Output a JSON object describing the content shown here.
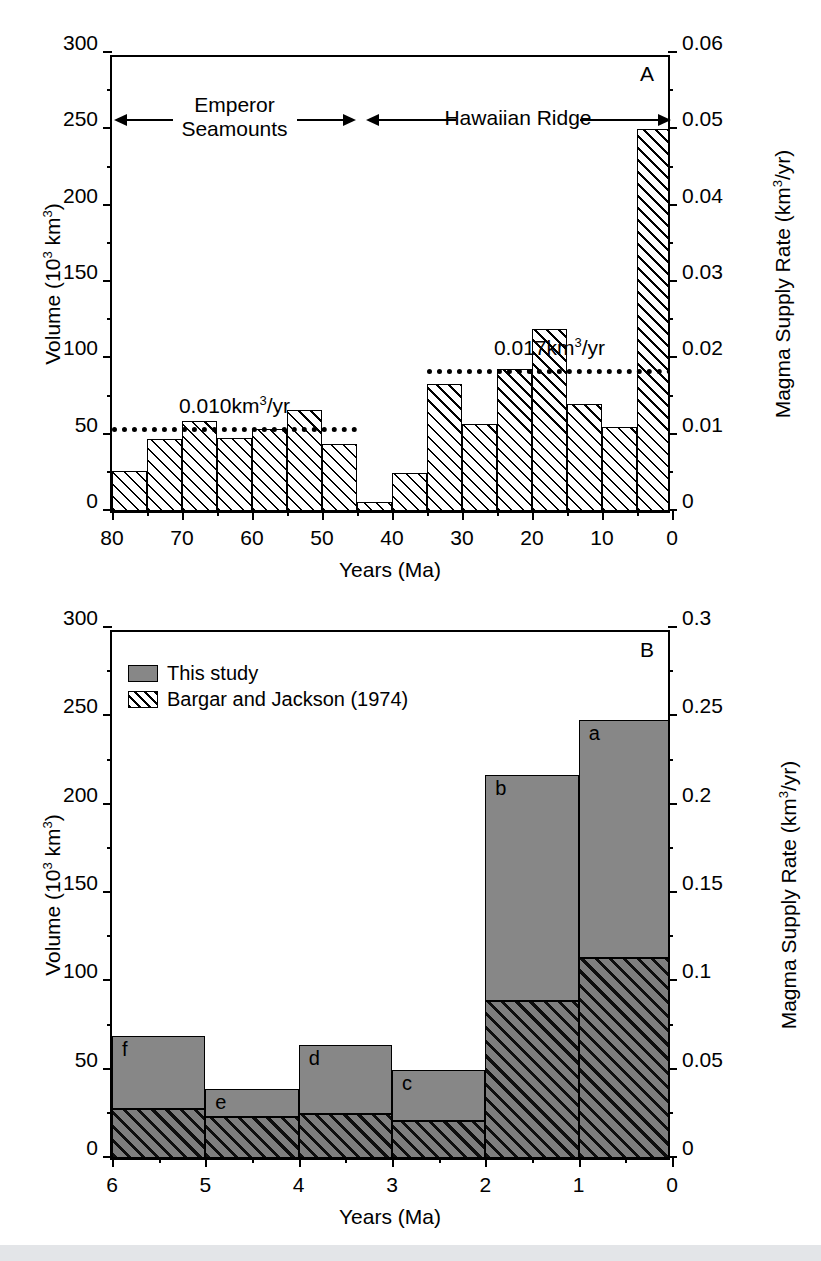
{
  "figure": {
    "panel_a_letter": "A",
    "panel_b_letter": "B"
  },
  "chart_data": [
    {
      "id": "panel-a",
      "type": "bar",
      "title": "",
      "panel_label": "A",
      "xlabel": "Years (Ma)",
      "ylabel": "Volume (10³ km³)",
      "y2label": "Magma Supply Rate (km³/yr)",
      "xlim": [
        80,
        0
      ],
      "ylim": [
        0,
        300
      ],
      "y2lim": [
        0,
        0.06
      ],
      "x_reversed": true,
      "grid": false,
      "legend": "none",
      "xticks": [
        80,
        75,
        70,
        65,
        60,
        55,
        50,
        45,
        40,
        35,
        30,
        25,
        20,
        15,
        10,
        5,
        0
      ],
      "xticklabels": [
        "80",
        "",
        "70",
        "",
        "60",
        "",
        "50",
        "",
        "40",
        "",
        "30",
        "",
        "20",
        "",
        "10",
        "",
        "0"
      ],
      "yticks": [
        0,
        50,
        100,
        150,
        200,
        250,
        300
      ],
      "yticklabels": [
        "0",
        "50",
        "100",
        "150",
        "200",
        "250",
        "300"
      ],
      "y2ticks": [
        0,
        0.01,
        0.02,
        0.03,
        0.04,
        0.05,
        0.06
      ],
      "y2ticklabels": [
        "0",
        "0.01",
        "0.02",
        "0.03",
        "0.04",
        "0.05",
        "0.06"
      ],
      "bin_width_ma": 5,
      "bins": [
        {
          "from": 80,
          "to": 75,
          "value": 26
        },
        {
          "from": 75,
          "to": 70,
          "value": 47
        },
        {
          "from": 70,
          "to": 65,
          "value": 59
        },
        {
          "from": 65,
          "to": 60,
          "value": 48
        },
        {
          "from": 60,
          "to": 55,
          "value": 54
        },
        {
          "from": 55,
          "to": 50,
          "value": 66
        },
        {
          "from": 50,
          "to": 45,
          "value": 44
        },
        {
          "from": 45,
          "to": 40,
          "value": 6
        },
        {
          "from": 40,
          "to": 35,
          "value": 25
        },
        {
          "from": 35,
          "to": 30,
          "value": 83
        },
        {
          "from": 30,
          "to": 25,
          "value": 57
        },
        {
          "from": 25,
          "to": 20,
          "value": 93
        },
        {
          "from": 20,
          "to": 15,
          "value": 119
        },
        {
          "from": 15,
          "to": 10,
          "value": 70
        },
        {
          "from": 10,
          "to": 5,
          "value": 55
        },
        {
          "from": 5,
          "to": 0,
          "value": 250
        }
      ],
      "reference_lines": [
        {
          "label": "0.010km³/yr",
          "value_rate": 0.01,
          "value_volume": 52,
          "from": 80,
          "to": 45
        },
        {
          "label": "0.017km³/yr",
          "value_rate": 0.017,
          "value_volume": 90,
          "from": 35,
          "to": 0
        }
      ],
      "range_annotations": [
        {
          "label_line1": "Emperor",
          "label_line2": "Seamounts",
          "from": 80,
          "to": 45
        },
        {
          "label_line1": "Hawaiian Ridge",
          "label_line2": "",
          "from": 44,
          "to": 0
        }
      ]
    },
    {
      "id": "panel-b",
      "type": "bar",
      "title": "",
      "panel_label": "B",
      "xlabel": "Years (Ma)",
      "ylabel": "Volume (10³ km³)",
      "y2label": "Magma Supply Rate (km³/yr)",
      "xlim": [
        6,
        0
      ],
      "ylim": [
        0,
        300
      ],
      "y2lim": [
        0,
        0.3
      ],
      "x_reversed": true,
      "grid": false,
      "legend": "upper-left",
      "stacked": true,
      "xticks": [
        6,
        5,
        4,
        3,
        2,
        1,
        0
      ],
      "xticklabels": [
        "6",
        "5",
        "4",
        "3",
        "2",
        "1",
        "0"
      ],
      "yticks": [
        0,
        50,
        100,
        150,
        200,
        250,
        300
      ],
      "yticklabels": [
        "0",
        "50",
        "100",
        "150",
        "200",
        "250",
        "300"
      ],
      "y2ticks": [
        0,
        0.05,
        0.1,
        0.15,
        0.2,
        0.25,
        0.3
      ],
      "y2ticklabels": [
        "0",
        "0.05",
        "0.1",
        "0.15",
        "0.2",
        "0.25",
        "0.3"
      ],
      "series": [
        {
          "name": "Bargar and Jackson (1974)",
          "fill": "hatched",
          "values": [
            28,
            23,
            25,
            21,
            89,
            113
          ]
        },
        {
          "name": "This study",
          "fill": "gray",
          "values": [
            41,
            16,
            39,
            29,
            128,
            135
          ]
        }
      ],
      "bins": [
        {
          "from": 6,
          "to": 5,
          "letter": "f",
          "total": 69,
          "lower": 28,
          "upper": 41
        },
        {
          "from": 5,
          "to": 4,
          "letter": "e",
          "total": 39,
          "lower": 23,
          "upper": 16
        },
        {
          "from": 4,
          "to": 3,
          "letter": "d",
          "total": 64,
          "lower": 25,
          "upper": 39
        },
        {
          "from": 3,
          "to": 2,
          "letter": "c",
          "total": 50,
          "lower": 21,
          "upper": 29
        },
        {
          "from": 2,
          "to": 1,
          "letter": "b",
          "total": 217,
          "lower": 89,
          "upper": 128
        },
        {
          "from": 1,
          "to": 0,
          "letter": "a",
          "total": 248,
          "lower": 113,
          "upper": 135
        }
      ],
      "legend_entries": [
        {
          "label": "This study",
          "fill": "gray"
        },
        {
          "label": "Bargar and Jackson (1974)",
          "fill": "hatched"
        }
      ]
    }
  ]
}
